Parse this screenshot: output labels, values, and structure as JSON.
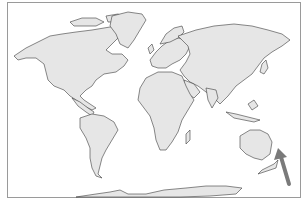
{
  "map": {
    "type": "world-outline-map",
    "projection": "equirectangular-like",
    "land_fill": "#e6e6e6",
    "coast_stroke": "#3a3a3a",
    "frame_color": "#9a9a9a",
    "background": "#ffffff",
    "continents": [
      "North America",
      "South America",
      "Europe",
      "Africa",
      "Asia",
      "Australia",
      "Antarctica",
      "Greenland"
    ],
    "annotation": {
      "type": "arrow",
      "color": "#7a7a7a",
      "points_to": "east of Australia / Pacific islands (near New Caledonia / Vanuatu)",
      "tail": [
        289,
        184
      ],
      "head": [
        278,
        148
      ]
    }
  }
}
